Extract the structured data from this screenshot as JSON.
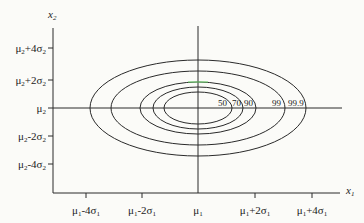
{
  "diagram": {
    "type": "bivariate normal contour plot",
    "axes": {
      "x_label": "x1",
      "y_label": "x2"
    },
    "y_ticks": [
      {
        "label_main": "μ",
        "sub1": "2",
        "rest": "+4σ",
        "sub2": "2",
        "y": 48
      },
      {
        "label_main": "μ",
        "sub1": "2",
        "rest": "+2σ",
        "sub2": "2",
        "y": 80
      },
      {
        "label_main": "μ",
        "sub1": "2",
        "rest": "",
        "sub2": "",
        "y": 108
      },
      {
        "label_main": "μ",
        "sub1": "2",
        "rest": "-2σ",
        "sub2": "2",
        "y": 136
      },
      {
        "label_main": "μ",
        "sub1": "2",
        "rest": "-4σ",
        "sub2": "2",
        "y": 164
      }
    ],
    "x_ticks": [
      {
        "label_main": "μ",
        "sub1": "1",
        "rest": "-4σ",
        "sub2": "1",
        "x": 86
      },
      {
        "label_main": "μ",
        "sub1": "1",
        "rest": "-2σ",
        "sub2": "1",
        "x": 142
      },
      {
        "label_main": "μ",
        "sub1": "1",
        "rest": "",
        "sub2": "",
        "x": 198
      },
      {
        "label_main": "μ",
        "sub1": "1",
        "rest": "+2σ",
        "sub2": "1",
        "x": 255
      },
      {
        "label_main": "μ",
        "sub1": "1",
        "rest": "+4σ",
        "sub2": "1",
        "x": 312
      }
    ],
    "contours": [
      {
        "label": "50",
        "rx": 34,
        "ry": 16
      },
      {
        "label": "70",
        "rx": 45,
        "ry": 21
      },
      {
        "label": "90",
        "rx": 58,
        "ry": 26
      },
      {
        "label": "99",
        "rx": 87,
        "ry": 37
      },
      {
        "label": "99.9",
        "rx": 108,
        "ry": 48
      }
    ],
    "center": {
      "x": 198,
      "y": 108
    },
    "line_color": "#2a2a2a"
  }
}
